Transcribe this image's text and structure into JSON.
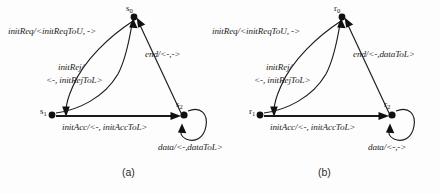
{
  "figure": {
    "background_color": "#fdfdfd",
    "ink_color": "#101010",
    "panels": [
      {
        "id": "panel-a",
        "caption": "(a)",
        "states": [
          {
            "id": "s0",
            "label_html": "s0",
            "label_base": "s",
            "label_sub": "0"
          },
          {
            "id": "s1",
            "label_html": "s1",
            "label_base": "s",
            "label_sub": "1"
          },
          {
            "id": "s2",
            "label_html": "s2",
            "label_base": "s",
            "label_sub": "2"
          }
        ],
        "transitions": [
          {
            "id": "init-req",
            "from": "s0",
            "to": "s1",
            "label": "initReq/<initReqToU, ->"
          },
          {
            "id": "init-rej",
            "from": "s1",
            "to": "s0",
            "label_line1": "initRej/",
            "label_line2": "<-, initRejToL>"
          },
          {
            "id": "init-acc",
            "from": "s1",
            "to": "s2",
            "label": "initAcc/<-, initAccToL>"
          },
          {
            "id": "end",
            "from": "s2",
            "to": "s0",
            "label": "end/<-,->"
          },
          {
            "id": "data-loop",
            "from": "s2",
            "to": "s2",
            "label": "data/<-,dataToL>"
          }
        ]
      },
      {
        "id": "panel-b",
        "caption": "(b)",
        "states": [
          {
            "id": "r0",
            "label_html": "r0",
            "label_base": "r",
            "label_sub": "0"
          },
          {
            "id": "r1",
            "label_html": "r1",
            "label_base": "r",
            "label_sub": "1"
          },
          {
            "id": "r2",
            "label_html": "r2",
            "label_base": "r",
            "label_sub": "2"
          }
        ],
        "transitions": [
          {
            "id": "init-req",
            "from": "r0",
            "to": "r1",
            "label": "initReq/<initReqToU, ->"
          },
          {
            "id": "init-rej",
            "from": "r1",
            "to": "r0",
            "label_line1": "initRej/",
            "label_line2": "<-, initRejToL>"
          },
          {
            "id": "init-acc",
            "from": "r1",
            "to": "r2",
            "label": "initAcc/<-, initAccToL>"
          },
          {
            "id": "end",
            "from": "r2",
            "to": "r0",
            "label": "end/<-,dataToL>"
          },
          {
            "id": "data-loop",
            "from": "r2",
            "to": "r2",
            "label": "data/<-,->"
          }
        ]
      }
    ]
  }
}
